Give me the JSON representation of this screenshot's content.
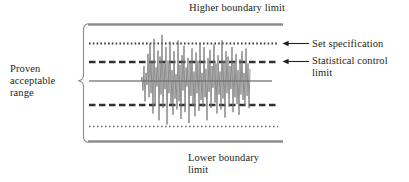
{
  "figure": {
    "title_top": "Higher boundary limit",
    "title_bottom": "Lower boundary\nlimit",
    "left_label": "Proven\nacceptable\nrange",
    "annotations": [
      {
        "name": "set-specification",
        "label": "Set specification"
      },
      {
        "name": "statistical-control-limit",
        "label": "Statistical control\nlimit"
      }
    ]
  },
  "colors": {
    "boundary_line": "#8c8c8c",
    "limit_line": "#3a3a3a",
    "signal_line": "#6e6e6e",
    "bracket": "#8a8a8a",
    "arrow": "#231f20",
    "text": "#231f20",
    "background": "#ffffff"
  },
  "chart_data": {
    "type": "line",
    "title": "Higher boundary limit",
    "xlabel": "",
    "ylabel": "",
    "grid": false,
    "legend_position": "right",
    "xlim": [
      0,
      100
    ],
    "ylim": [
      -100,
      100
    ],
    "reference_lines": [
      {
        "name": "higher-boundary-limit",
        "label": "Higher boundary limit",
        "value": 100,
        "style": "solid-thick",
        "color": "#8c8c8c"
      },
      {
        "name": "upper-set-specification",
        "label": "Set specification",
        "value": 62,
        "style": "dotted",
        "color": "#3a3a3a"
      },
      {
        "name": "upper-statistical-control-limit",
        "label": "Statistical control limit",
        "value": 28,
        "style": "dashed",
        "color": "#3a3a3a"
      },
      {
        "name": "center-line",
        "label": "",
        "value": 0,
        "style": "solid-thin",
        "color": "#4a4a4a"
      },
      {
        "name": "lower-statistical-control-limit",
        "label": "Statistical control limit",
        "value": -43,
        "style": "dashed",
        "color": "#3a3a3a"
      },
      {
        "name": "lower-set-specification",
        "label": "Set specification",
        "value": -80,
        "style": "dotted",
        "color": "#3a3a3a"
      },
      {
        "name": "lower-boundary-limit",
        "label": "Lower boundary limit",
        "value": -107,
        "style": "solid-thick",
        "color": "#8c8c8c"
      }
    ],
    "series": [
      {
        "name": "process-signal",
        "color": "#6e6e6e",
        "x_range": [
          141,
          250
        ],
        "values": [
          0,
          6,
          -14,
          22,
          -30,
          12,
          -6,
          40,
          -24,
          55,
          -18,
          30,
          -48,
          62,
          -36,
          20,
          -8,
          45,
          -58,
          36,
          -20,
          68,
          -40,
          26,
          -12,
          50,
          -64,
          30,
          -18,
          58,
          -34,
          16,
          -50,
          44,
          -26,
          10,
          -42,
          60,
          -30,
          24,
          -56,
          38,
          -14,
          52,
          -46,
          20,
          -8,
          34,
          -62,
          28,
          -22,
          48,
          -36,
          14,
          -52,
          42,
          -18,
          30,
          -44,
          56,
          -28,
          12,
          -38,
          50,
          -24,
          18,
          -58,
          34,
          -16,
          46,
          -40,
          22,
          -10,
          54,
          -32,
          26,
          -48,
          38,
          -20,
          14,
          -42,
          60,
          -26,
          30,
          -54,
          44,
          -18,
          36,
          -38,
          22,
          -12,
          50,
          -46,
          28,
          -24,
          40,
          -34,
          16,
          -50,
          32,
          -20,
          44,
          -28,
          12,
          -36,
          48,
          -22,
          26,
          -40,
          18
        ]
      }
    ]
  }
}
